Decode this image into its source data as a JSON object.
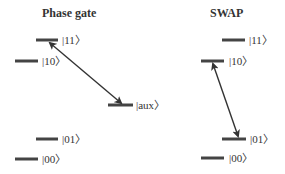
{
  "panels": [
    {
      "title": "Phase gate",
      "levels": [
        {
          "label": "|11〉",
          "x1": 36,
          "x2": 58,
          "y": 40
        },
        {
          "label": "|10〉",
          "x1": 15,
          "x2": 38,
          "y": 61
        },
        {
          "label": "|aux〉",
          "x1": 108,
          "x2": 133,
          "y": 105
        },
        {
          "label": "|01〉",
          "x1": 36,
          "x2": 58,
          "y": 139
        },
        {
          "label": "|00〉",
          "x1": 15,
          "x2": 38,
          "y": 159
        }
      ],
      "arrow": {
        "from": "|11〉",
        "to": "|aux〉",
        "type": "double-headed"
      }
    },
    {
      "title": "SWAP",
      "levels": [
        {
          "label": "|11〉",
          "x1": 222,
          "x2": 245,
          "y": 40
        },
        {
          "label": "|10〉",
          "x1": 201,
          "x2": 224,
          "y": 61
        },
        {
          "label": "|01〉",
          "x1": 222,
          "x2": 246,
          "y": 139
        },
        {
          "label": "|00〉",
          "x1": 201,
          "x2": 224,
          "y": 158
        }
      ],
      "arrow": {
        "from": "|10〉",
        "to": "|01〉",
        "type": "double-headed"
      }
    }
  ]
}
